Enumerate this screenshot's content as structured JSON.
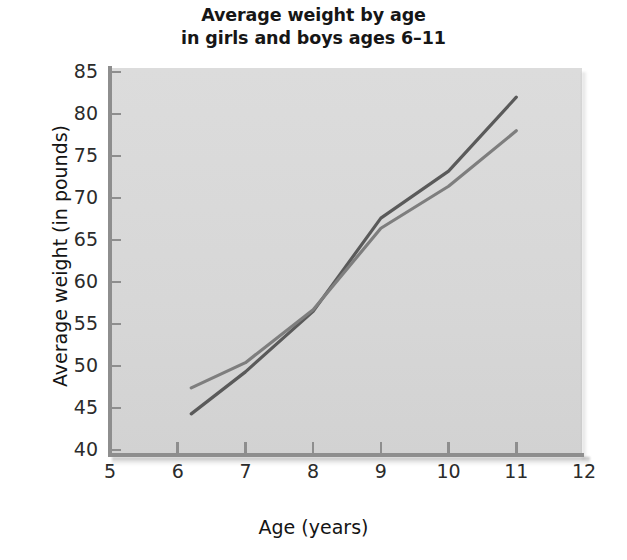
{
  "chart_data": {
    "type": "line",
    "title": "Average weight by age in girls and boys ages 6–11",
    "title_line1": "Average weight by age",
    "title_line2": "in girls and boys ages 6–11",
    "xlabel": "Age (years)",
    "ylabel": "Average weight (in pounds)",
    "xlim": [
      5,
      12
    ],
    "ylim": [
      40,
      85
    ],
    "xticks": [
      5,
      6,
      7,
      8,
      9,
      10,
      11,
      12
    ],
    "yticks": [
      40,
      45,
      50,
      55,
      60,
      65,
      70,
      75,
      80,
      85
    ],
    "xticklabels": [
      "5",
      "6",
      "7",
      "8",
      "9",
      "10",
      "11",
      "12"
    ],
    "yticklabels": [
      "40",
      "45",
      "50",
      "55",
      "60",
      "65",
      "70",
      "75",
      "80",
      "85"
    ],
    "grid": false,
    "legend": null,
    "plot_background": "#d9d9d9",
    "series": [
      {
        "name": "boys",
        "color": "#5a5a5a",
        "x": [
          6.2,
          7,
          8,
          9,
          10,
          11
        ],
        "values": [
          44.3,
          49.3,
          56.5,
          67.6,
          73.2,
          82.0
        ]
      },
      {
        "name": "girls",
        "color": "#7e7e7e",
        "x": [
          6.2,
          7,
          8,
          9,
          10,
          11
        ],
        "values": [
          47.4,
          50.4,
          56.7,
          66.4,
          71.4,
          78.0
        ]
      }
    ]
  },
  "chart": {
    "title_line1": "Average weight by age",
    "title_line2": "in girls and boys ages 6–11",
    "xlabel": "Age (years)",
    "ylabel": "Average weight (in pounds)"
  }
}
